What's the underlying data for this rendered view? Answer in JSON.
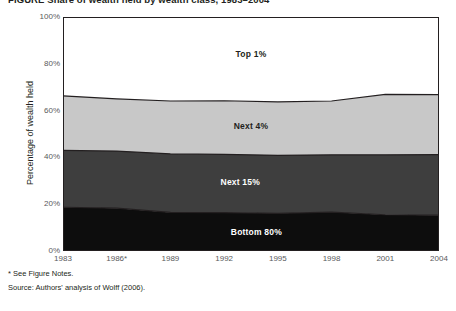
{
  "figure": {
    "title": "FIGURE  Share of wealth held by wealth class, 1983–2004",
    "footnotes": [
      "* See Figure Notes.",
      "Source: Authors' analysis of Wolff (2006)."
    ]
  },
  "chart_data": {
    "type": "area",
    "title": "",
    "xlabel": "",
    "ylabel": "Percentage of wealth held",
    "x": [
      "1983",
      "1986*",
      "1989",
      "1992",
      "1995",
      "1998",
      "2001",
      "2004"
    ],
    "xtick_labels": [
      "1983",
      "1986*",
      "1989",
      "1992",
      "1995",
      "1998",
      "2001",
      "2004"
    ],
    "ytick_labels": [
      "0%",
      "20%",
      "40%",
      "60%",
      "80%",
      "100%"
    ],
    "yticks": [
      0,
      20,
      40,
      60,
      80,
      100
    ],
    "ylim": [
      0,
      100
    ],
    "grid": false,
    "legend_position": "inline-labels",
    "stacked": true,
    "stack_order_bottom_to_top": [
      "Bottom 80%",
      "Next 15%",
      "Next 4%",
      "Top 1%"
    ],
    "series": [
      {
        "name": "Bottom 80%",
        "color": "#0d0d0d",
        "label_color": "#ffffff",
        "values": [
          18.7,
          18.3,
          16.5,
          16.4,
          16.1,
          16.6,
          15.5,
          15.3
        ],
        "cumulative_top": [
          18.7,
          18.3,
          16.5,
          16.4,
          16.1,
          16.6,
          15.5,
          15.3
        ]
      },
      {
        "name": "Next 15%",
        "color": "#3e3e3e",
        "label_color": "#ffffff",
        "values": [
          24.3,
          24.4,
          25.0,
          24.9,
          24.8,
          24.5,
          25.6,
          25.9
        ],
        "cumulative_top": [
          43.0,
          42.7,
          41.5,
          41.3,
          40.9,
          41.1,
          41.1,
          41.2
        ]
      },
      {
        "name": "Next 4%",
        "color": "#c8c8c8",
        "label_color": "#231f20",
        "values": [
          23.3,
          22.3,
          22.6,
          22.9,
          22.8,
          23.0,
          25.8,
          25.6
        ],
        "cumulative_top": [
          66.3,
          65.0,
          64.1,
          64.2,
          63.7,
          64.1,
          66.9,
          66.8
        ]
      },
      {
        "name": "Top 1%",
        "color": "#ffffff",
        "label_color": "#231f20",
        "values": [
          33.7,
          35.0,
          35.9,
          35.8,
          36.3,
          35.9,
          33.1,
          33.2
        ],
        "cumulative_top": [
          100,
          100,
          100,
          100,
          100,
          100,
          100,
          100
        ]
      }
    ],
    "series_label_positions": [
      {
        "name": "Top 1%",
        "x_index": 3.5,
        "y_value": 84.0
      },
      {
        "name": "Next 4%",
        "x_index": 3.5,
        "y_value": 53.5
      },
      {
        "name": "Next 15%",
        "x_index": 3.3,
        "y_value": 29.5
      },
      {
        "name": "Bottom 80%",
        "x_index": 3.6,
        "y_value": 8.0
      }
    ],
    "axis_color": "#231f20",
    "boundary_line_color": "#231f20"
  }
}
